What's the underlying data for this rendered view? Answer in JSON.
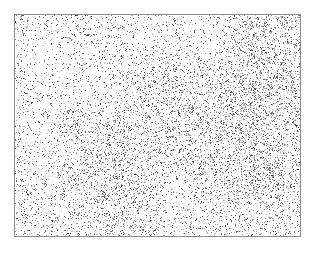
{
  "page": {
    "width": 316,
    "height": 253,
    "background_color": "#ffffff",
    "margin_top": 14,
    "margin_left": 14,
    "margin_right": 15,
    "margin_bottom": 16,
    "caption": ""
  },
  "plate": {
    "label": "",
    "x": 14,
    "y": 14,
    "width": 287,
    "height": 223,
    "border_color": "#8d8d8d",
    "border_width": 1,
    "fill_color": "#ffffff"
  },
  "texture": {
    "name": "grayscale-speckle-noise",
    "description": "Fine high-frequency dark speckle grain on white, scanned halftone appearance",
    "ink_color": "#4a4a4a",
    "ink_color_dark": "#2b2b2b",
    "ink_color_light": "#9a9a9a",
    "background_color": "#ffffff",
    "base_coverage": 0.17,
    "grain_size_px": 1,
    "clump_size_px": 2,
    "seed": 20240517,
    "density_field": {
      "description": "Relative speckle density by region of the plate, 0 = blank, 1 = densest",
      "grid_cols": 4,
      "grid_rows": 4,
      "values": [
        [
          0.55,
          0.6,
          0.72,
          0.95
        ],
        [
          0.62,
          0.7,
          0.78,
          0.9
        ],
        [
          0.8,
          0.88,
          0.74,
          0.82
        ],
        [
          0.7,
          0.76,
          0.68,
          0.72
        ]
      ]
    }
  }
}
